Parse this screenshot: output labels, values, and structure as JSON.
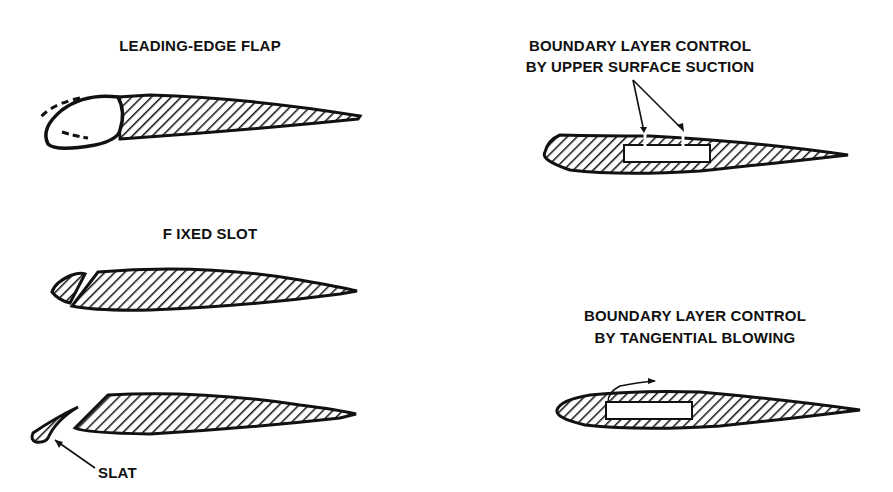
{
  "diagram": {
    "colors": {
      "ink": "#111111",
      "background": "#ffffff"
    },
    "panels": [
      {
        "id": "leading-edge-flap",
        "label": "LEADING-EDGE FLAP"
      },
      {
        "id": "fixed-slot",
        "label": "F IXED SLOT"
      },
      {
        "id": "slat",
        "label": "SLAT"
      },
      {
        "id": "blc-suction",
        "label_line1": "BOUNDARY LAYER CONTROL",
        "label_line2": "BY UPPER SURFACE SUCTION"
      },
      {
        "id": "blc-blowing",
        "label_line1": "BOUNDARY LAYER CONTROL",
        "label_line2": "BY TANGENTIAL BLOWING"
      }
    ]
  }
}
